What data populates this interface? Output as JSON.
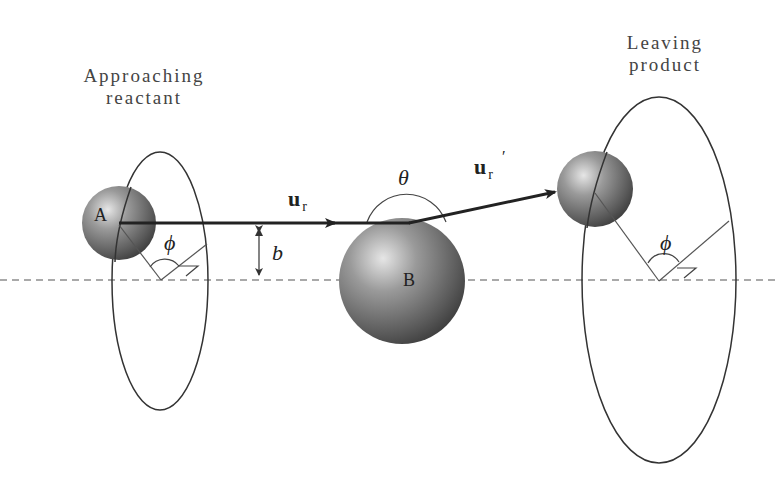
{
  "diagram": {
    "labels": {
      "approaching": [
        "Approaching",
        "reactant"
      ],
      "leaving": [
        "Leaving",
        "product"
      ],
      "particle_a": "A",
      "particle_b": "B",
      "velocity_in": "u",
      "velocity_in_sub": "r",
      "velocity_out": "u",
      "velocity_out_sub": "r",
      "velocity_out_prime": "′",
      "theta": "θ",
      "phi_left": "ϕ",
      "phi_right": "ϕ",
      "impact_parameter": "b"
    },
    "colors": {
      "line": "#222222",
      "thin_line": "#555555",
      "sphere_dark": "#3a3a3a",
      "sphere_light": "#d8d8d8",
      "text": "#444444"
    }
  }
}
